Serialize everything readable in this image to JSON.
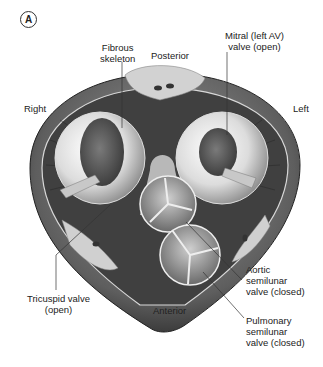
{
  "figure": {
    "panel_label": "A",
    "labels": {
      "fibrous_skeleton": [
        "Fibrous",
        "skeleton"
      ],
      "posterior": "Posterior",
      "mitral": [
        "Mitral (left AV)",
        "valve (open)"
      ],
      "right": "Right",
      "left": "Left",
      "tricuspid": [
        "Tricuspid valve",
        "(open)"
      ],
      "anterior": "Anterior",
      "aortic": [
        "Aortic",
        "semilunar",
        "valve (closed)"
      ],
      "pulmonary": [
        "Pulmonary",
        "semilunar",
        "valve (closed)"
      ]
    },
    "colors": {
      "outer": "#6e6e6e",
      "ring": "#3a3a3a",
      "valve_light": "#e8e8e8",
      "valve_dark": "#5a5a5a",
      "fat": "#cfcfcf"
    }
  }
}
